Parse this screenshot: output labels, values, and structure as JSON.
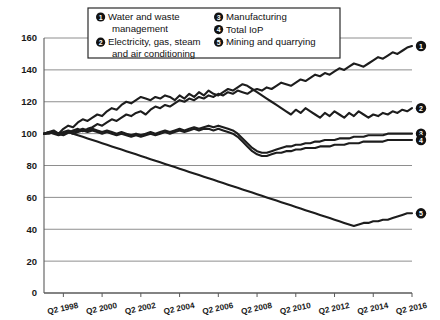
{
  "chart_data": {
    "type": "line",
    "title": "",
    "xlabel": "",
    "ylabel": "",
    "ylim": [
      0,
      160
    ],
    "y_ticks": [
      0,
      20,
      40,
      60,
      80,
      100,
      120,
      140,
      160
    ],
    "grid": true,
    "legend_position": "top-center",
    "x_tick_labels": [
      "Q2 1998",
      "Q2 2000",
      "Q2 2002",
      "Q2 2004",
      "Q2 2006",
      "Q2 2008",
      "Q2 2010",
      "Q2 2012",
      "Q2 2014",
      "Q2 2016"
    ],
    "x_start": "Q2 1997",
    "x_end": "Q2 2016",
    "x_index_range": [
      0,
      76
    ],
    "series": [
      {
        "name": "Water and waste management",
        "marker": "1",
        "end_label": "1",
        "end_value": 155,
        "values": [
          100,
          100.5,
          101,
          100,
          99,
          100.5,
          102,
          103,
          101.5,
          103,
          104,
          106,
          105,
          107,
          109,
          108,
          110,
          112,
          111,
          113,
          114,
          112,
          115,
          117,
          116,
          118,
          117,
          119,
          121,
          120,
          122,
          121,
          123,
          122,
          124,
          123,
          125,
          124,
          126,
          125,
          127,
          126,
          125,
          127,
          128,
          127,
          129,
          128,
          130,
          132,
          131,
          130,
          132,
          134,
          133,
          135,
          137,
          136,
          138,
          137,
          139,
          141,
          140,
          142,
          144,
          143,
          142,
          144,
          146,
          148,
          147,
          149,
          151,
          150,
          152,
          154,
          155
        ]
      },
      {
        "name": "Electricity, gas, steam and air conditioning",
        "marker": "2",
        "end_label": "2",
        "end_value": 116,
        "values": [
          100,
          101,
          102,
          100,
          103,
          105,
          104,
          107,
          109,
          108,
          110,
          112,
          111,
          114,
          116,
          115,
          118,
          120,
          119,
          121,
          123,
          122,
          121,
          123,
          122,
          124,
          123,
          121,
          124,
          122,
          125,
          123,
          126,
          124,
          127,
          125,
          124,
          126,
          128,
          127,
          129,
          131,
          130,
          128,
          126,
          124,
          122,
          120,
          118,
          116,
          114,
          112,
          115,
          113,
          116,
          114,
          112,
          110,
          113,
          111,
          114,
          112,
          110,
          113,
          111,
          114,
          112,
          110,
          112,
          111,
          113,
          112,
          114,
          113,
          115,
          114,
          116
        ]
      },
      {
        "name": "Manufacturing",
        "marker": "3",
        "end_label": "3",
        "end_value": 100,
        "values": [
          100,
          100.5,
          101,
          100,
          101,
          102,
          101,
          102,
          103,
          102,
          103,
          102,
          101,
          102,
          101,
          100,
          101,
          100,
          99,
          100,
          99,
          100,
          101,
          100,
          101,
          102,
          101,
          102,
          103,
          102,
          103,
          104,
          103,
          104,
          105,
          104,
          105,
          104,
          103,
          102,
          100,
          97,
          94,
          91,
          89,
          88,
          88,
          89,
          90,
          91,
          92,
          92,
          93,
          93,
          94,
          94,
          95,
          95,
          96,
          96,
          96,
          97,
          97,
          97,
          98,
          98,
          98,
          99,
          99,
          99,
          99,
          100,
          100,
          100,
          100,
          100,
          100
        ]
      },
      {
        "name": "Total IoP",
        "marker": "4",
        "end_label": "4",
        "end_value": 96,
        "values": [
          100,
          100,
          101,
          100,
          100,
          101,
          100,
          101,
          102,
          101,
          102,
          101,
          100,
          101,
          100,
          99,
          100,
          99,
          98,
          99,
          98,
          99,
          100,
          99,
          100,
          101,
          100,
          101,
          102,
          101,
          102,
          103,
          102,
          103,
          103,
          102,
          103,
          102,
          101,
          100,
          98,
          95,
          92,
          89,
          87,
          86,
          86,
          87,
          88,
          88,
          89,
          89,
          90,
          90,
          91,
          91,
          91,
          92,
          92,
          92,
          93,
          93,
          93,
          94,
          94,
          94,
          95,
          95,
          95,
          95,
          95,
          96,
          96,
          96,
          96,
          96,
          96
        ]
      },
      {
        "name": "Mining and quarrying",
        "marker": "5",
        "end_label": "5",
        "end_value": 50,
        "values": [
          100,
          101,
          100,
          99,
          100,
          101,
          100,
          99,
          98,
          97,
          96,
          95,
          94,
          93,
          92,
          91,
          90,
          89,
          88,
          87,
          86,
          85,
          84,
          83,
          82,
          81,
          80,
          79,
          78,
          77,
          76,
          75,
          74,
          73,
          72,
          71,
          70,
          69,
          68,
          67,
          66,
          65,
          64,
          63,
          62,
          61,
          60,
          59,
          58,
          57,
          56,
          55,
          54,
          53,
          52,
          51,
          50,
          49,
          48,
          47,
          46,
          45,
          44,
          43,
          42,
          43,
          44,
          44,
          45,
          45,
          46,
          46,
          47,
          48,
          49,
          50,
          50
        ]
      }
    ]
  },
  "legend": {
    "items": [
      {
        "num": "1",
        "lines": [
          "Water and waste",
          "management"
        ]
      },
      {
        "num": "2",
        "lines": [
          "Electricity, gas, steam",
          "and air conditioning"
        ]
      },
      {
        "num": "3",
        "lines": [
          "Manufacturing"
        ]
      },
      {
        "num": "4",
        "lines": [
          "Total IoP"
        ]
      },
      {
        "num": "5",
        "lines": [
          "Mining and quarrying"
        ]
      }
    ]
  }
}
